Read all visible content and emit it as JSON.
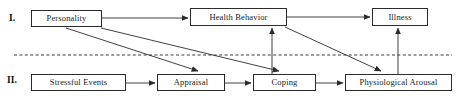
{
  "diagram": {
    "tiers": [
      {
        "id": "tier-1",
        "label": "I.",
        "x": 9,
        "y": 14
      },
      {
        "id": "tier-2",
        "label": "II.",
        "x": 7,
        "y": 76
      }
    ],
    "nodes": [
      {
        "id": "personality",
        "label": "Personality",
        "x": 31,
        "y": 10,
        "w": 71,
        "h": 17
      },
      {
        "id": "health-behavior",
        "label": "Health Behavior",
        "x": 190,
        "y": 8,
        "w": 97,
        "h": 18
      },
      {
        "id": "illness",
        "label": "Illness",
        "x": 372,
        "y": 8,
        "w": 56,
        "h": 18
      },
      {
        "id": "stressful-events",
        "label": "Stressful Events",
        "x": 31,
        "y": 74,
        "w": 95,
        "h": 17
      },
      {
        "id": "appraisal",
        "label": "Appraisal",
        "x": 157,
        "y": 74,
        "w": 68,
        "h": 17
      },
      {
        "id": "coping",
        "label": "Coping",
        "x": 253,
        "y": 74,
        "w": 63,
        "h": 17
      },
      {
        "id": "physiological-arousal",
        "label": "Physiological Arousal",
        "x": 345,
        "y": 74,
        "w": 107,
        "h": 17
      }
    ],
    "divider": {
      "id": "tier-divider",
      "style": "dashed",
      "x1": 14,
      "y1": 55,
      "x2": 452,
      "y2": 55
    },
    "edges": [
      {
        "id": "edge-personality-health-behavior",
        "from": "personality",
        "to": "health-behavior",
        "kind": "horizontal",
        "x1": 102,
        "y1": 18,
        "x2": 188,
        "y2": 18
      },
      {
        "id": "edge-health-behavior-illness",
        "from": "health-behavior",
        "to": "illness",
        "kind": "horizontal",
        "x1": 287,
        "y1": 17,
        "x2": 370,
        "y2": 17
      },
      {
        "id": "edge-personality-appraisal",
        "from": "personality",
        "to": "appraisal",
        "kind": "diagonal",
        "x1": 66,
        "y1": 28,
        "x2": 198,
        "y2": 71
      },
      {
        "id": "edge-personality-coping",
        "from": "personality",
        "to": "coping",
        "kind": "diagonal",
        "x1": 101,
        "y1": 28,
        "x2": 279,
        "y2": 71
      },
      {
        "id": "edge-health-behavior-physiological",
        "from": "health-behavior",
        "to": "physiological-arousal",
        "kind": "diagonal",
        "x1": 285,
        "y1": 27,
        "x2": 381,
        "y2": 71
      },
      {
        "id": "edge-stressful-events-appraisal",
        "from": "stressful-events",
        "to": "appraisal",
        "kind": "horizontal",
        "x1": 126,
        "y1": 83,
        "x2": 155,
        "y2": 83
      },
      {
        "id": "edge-appraisal-coping",
        "from": "appraisal",
        "to": "coping",
        "kind": "horizontal",
        "x1": 225,
        "y1": 83,
        "x2": 251,
        "y2": 83
      },
      {
        "id": "edge-coping-physiological",
        "from": "coping",
        "to": "physiological-arousal",
        "kind": "horizontal",
        "x1": 316,
        "y1": 83,
        "x2": 343,
        "y2": 83
      },
      {
        "id": "edge-coping-health-behavior",
        "from": "coping",
        "to": "health-behavior",
        "kind": "vertical",
        "x1": 272,
        "y1": 74,
        "x2": 272,
        "y2": 28
      },
      {
        "id": "edge-physiological-illness",
        "from": "physiological-arousal",
        "to": "illness",
        "kind": "vertical",
        "x1": 398,
        "y1": 74,
        "x2": 398,
        "y2": 28
      }
    ],
    "colors": {
      "stroke": "#2b2b2b",
      "box_border": "#2b2b2b",
      "text": "#1a1a1a",
      "background": "#ffffff",
      "divider": "#3a3a3a"
    }
  }
}
